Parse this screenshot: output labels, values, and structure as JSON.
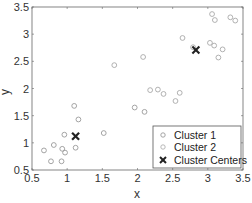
{
  "chart_data": {
    "type": "scatter",
    "title": "",
    "xlabel": "x",
    "ylabel": "y",
    "xlim": [
      0.5,
      3.5
    ],
    "ylim": [
      0.5,
      3.5
    ],
    "xticks": [
      "0.5",
      "1",
      "1.5",
      "2",
      "2.5",
      "3",
      "3.5"
    ],
    "yticks": [
      "0.5",
      "1",
      "1.5",
      "2",
      "2.5",
      "3",
      "3.5"
    ],
    "grid": false,
    "legend_position": "lower right",
    "series": [
      {
        "name": "Cluster 1",
        "marker": "circle",
        "color": "#9a9a9a",
        "points": [
          [
            1.1,
            1.68
          ],
          [
            1.16,
            1.43
          ],
          [
            0.96,
            1.15
          ],
          [
            1.52,
            1.18
          ],
          [
            0.81,
            0.96
          ],
          [
            0.67,
            0.86
          ],
          [
            0.93,
            0.89
          ],
          [
            0.97,
            0.82
          ],
          [
            1.12,
            0.91
          ],
          [
            0.77,
            0.66
          ],
          [
            0.92,
            0.66
          ],
          [
            1.96,
            1.65
          ],
          [
            2.1,
            1.57
          ]
        ]
      },
      {
        "name": "Cluster 2",
        "marker": "circle",
        "color": "#a8a8a8",
        "points": [
          [
            1.67,
            2.43
          ],
          [
            2.08,
            2.58
          ],
          [
            2.18,
            1.97
          ],
          [
            2.29,
            1.98
          ],
          [
            2.37,
            1.9
          ],
          [
            2.6,
            1.92
          ],
          [
            2.54,
            1.77
          ],
          [
            2.64,
            2.93
          ],
          [
            2.79,
            2.76
          ],
          [
            3.03,
            2.84
          ],
          [
            3.09,
            2.79
          ],
          [
            3.21,
            2.72
          ],
          [
            3.15,
            2.57
          ],
          [
            3.06,
            3.37
          ],
          [
            3.1,
            3.26
          ],
          [
            3.32,
            3.31
          ],
          [
            3.39,
            3.25
          ]
        ]
      },
      {
        "name": "Cluster Centers",
        "marker": "x",
        "color": "#222222",
        "points": [
          [
            1.12,
            1.12
          ],
          [
            2.83,
            2.71
          ]
        ]
      }
    ]
  },
  "legend": {
    "items": [
      "Cluster 1",
      "Cluster 2",
      "Cluster Centers"
    ]
  },
  "colors": {
    "axis": "#666666",
    "text": "#333333"
  }
}
